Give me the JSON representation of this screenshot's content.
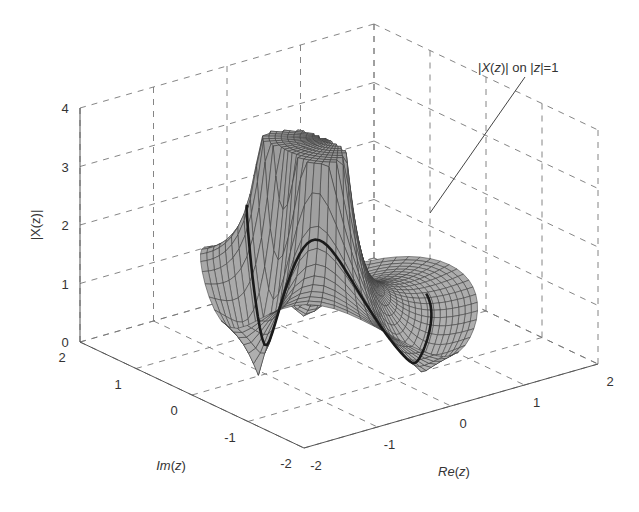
{
  "chart_data": {
    "type": "surface3d",
    "title": "",
    "xlabel": "Re(z)",
    "ylabel": "Im(z)",
    "zlabel": "|X(z)|",
    "xlim": [
      -2,
      2
    ],
    "ylim": [
      -2,
      2
    ],
    "zlim": [
      0,
      4
    ],
    "x_ticks": [
      "-2",
      "-1",
      "0",
      "1",
      "2"
    ],
    "y_ticks": [
      "2",
      "1",
      "0",
      "-1",
      "-2"
    ],
    "z_ticks": [
      "0",
      "1",
      "2",
      "3",
      "4"
    ],
    "grid": true,
    "grid_style": "dashed",
    "annotation": "|X(z)| on |z|=1",
    "surface": {
      "description": "Magnitude of X(z) over a polar grid in the z-plane, clipped at |X(z)|=4; two peaks (poles) near Re(z)~-0.6, Im(z)~±0.3; unit-circle trace drawn as thick dark curve",
      "grid": "polar",
      "radius_max": 1.5,
      "peak_height": 3.6,
      "left_wing_height": 1.9,
      "min_height": 0.0
    },
    "colors": {
      "surface_fill": "#a9a9a9",
      "mesh_line": "#3a3a3a",
      "unit_circle": "#1a1a1a",
      "grid": "#777777",
      "axis": "#555555"
    }
  },
  "labels": {
    "annotation_part1": "|",
    "annotation_X": "X",
    "annotation_part2": "(",
    "annotation_z1": "z",
    "annotation_part3": ")| on |",
    "annotation_z2": "z",
    "annotation_part4": "|=1",
    "zlabel": "|X(z)|",
    "xlabel_main": "Re",
    "xlabel_arg": "z",
    "ylabel_main": "Im",
    "ylabel_arg": "z"
  }
}
